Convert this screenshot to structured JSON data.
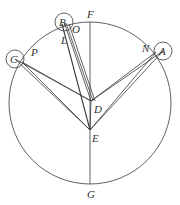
{
  "diagram": {
    "type": "geometric-construction",
    "main_circle": {
      "cx": 90,
      "cy": 103,
      "r": 81
    },
    "small_circles": [
      {
        "name": "B",
        "cx": 64,
        "cy": 22,
        "r": 9
      },
      {
        "name": "C",
        "cx": 15,
        "cy": 59,
        "r": 9
      },
      {
        "name": "A",
        "cx": 163,
        "cy": 51,
        "r": 9
      }
    ],
    "points": {
      "F": {
        "x": 90,
        "y": 22
      },
      "G": {
        "x": 90,
        "y": 184
      },
      "E": {
        "x": 90,
        "y": 130
      },
      "D": {
        "x": 91,
        "y": 101
      }
    },
    "labels": {
      "A": "A",
      "B": "B",
      "C": "C",
      "D": "D",
      "E": "E",
      "F": "F",
      "G": "G",
      "L": "L",
      "N": "N",
      "O": "O",
      "P": "P"
    }
  }
}
